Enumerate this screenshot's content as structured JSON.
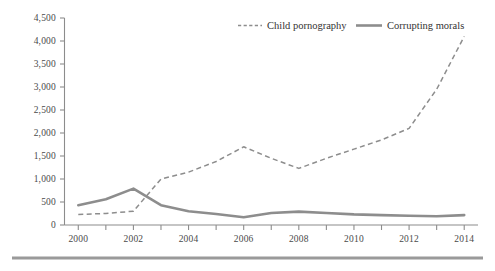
{
  "chart_data": {
    "type": "line",
    "title": "",
    "subtitle": "",
    "xlabel": "",
    "ylabel": "",
    "x": [
      2000,
      2001,
      2002,
      2003,
      2004,
      2005,
      2006,
      2007,
      2008,
      2009,
      2010,
      2011,
      2012,
      2013,
      2014
    ],
    "xlim": [
      1999.5,
      2014.5
    ],
    "ylim": [
      0,
      4500
    ],
    "grid": false,
    "legend_position": "top-right",
    "x_tick_values": [
      2000,
      2001,
      2002,
      2003,
      2004,
      2005,
      2006,
      2007,
      2008,
      2009,
      2010,
      2011,
      2012,
      2013,
      2014
    ],
    "x_tick_labels": [
      "2000",
      "",
      "2002",
      "",
      "2004",
      "",
      "2006",
      "",
      "2008",
      "",
      "2010",
      "",
      "2012",
      "",
      "2014"
    ],
    "y_tick_values": [
      0,
      500,
      1000,
      1500,
      2000,
      2500,
      3000,
      3500,
      4000,
      4500
    ],
    "y_tick_labels": [
      "0",
      "500",
      "1,000",
      "1,500",
      "2,000",
      "2,500",
      "3,000",
      "3,500",
      "4,000",
      "4,500"
    ],
    "series": [
      {
        "name": "Child pornography",
        "style": "dashed",
        "color": "#8d8d8d",
        "values": [
          230,
          250,
          300,
          1000,
          1150,
          1380,
          1700,
          1450,
          1230,
          1450,
          1650,
          1850,
          2100,
          2950,
          4100
        ]
      },
      {
        "name": "Corrupting morals",
        "style": "solid",
        "color": "#8d8d8d",
        "values": [
          430,
          560,
          790,
          430,
          300,
          240,
          170,
          260,
          290,
          260,
          230,
          215,
          200,
          190,
          215
        ]
      }
    ]
  },
  "legend": {
    "items": [
      {
        "label": "Child pornography",
        "style": "dashed"
      },
      {
        "label": "Corrupting morals",
        "style": "solid"
      }
    ]
  },
  "colors": {
    "line": "#8d8d8d",
    "axis": "#8c8c8c",
    "text": "#4a4a4a",
    "rule": "#9a9a9a",
    "background": "#ffffff"
  },
  "footer_rule": {
    "present": true
  }
}
